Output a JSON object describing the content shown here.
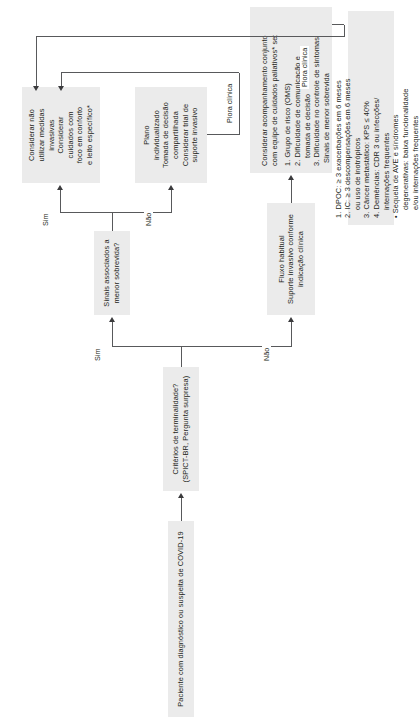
{
  "document": {
    "language": "pt-BR",
    "type": "flowchart",
    "orientation": "rotated-90-ccw"
  },
  "nodes": {
    "start": {
      "id": "start",
      "lines": [
        "Paciente com diagnóstico ou suspeita de COVID-19"
      ]
    },
    "criteria": {
      "id": "criteria",
      "lines": [
        "Critérios de terminalidade?",
        "(SPICT-BR, Pergunta surpresa)"
      ]
    },
    "survival": {
      "id": "survival",
      "lines": [
        "Sinais associados a",
        "menor sobrevida?"
      ]
    },
    "usual_flow": {
      "id": "usual_flow",
      "lines": [
        "Fluxo habitual",
        "Suporte invasivo conforme",
        "indicação clínica"
      ]
    },
    "individual_plan": {
      "id": "individual_plan",
      "lines": [
        "Plano",
        "individualizado",
        "Tomada de decisão",
        "compartilhada",
        "Considerar trial de",
        "suporte invasivo"
      ]
    },
    "no_invasive": {
      "id": "no_invasive",
      "lines": [
        "Considerar não",
        "utilizar medidas",
        "invasivas",
        "Considerar",
        "cuidados com",
        "foco em conforto",
        "e leito específico*"
      ]
    },
    "palliative": {
      "id": "palliative",
      "header": [
        "Considerar acompanhamento conjunto",
        "com equipe de cuidados paliativos* se:"
      ],
      "items": [
        "1. Grupo de risco (OMS)",
        "2. Dificuldade de comunicação e",
        "tomada de decisão",
        "3. Dificuldade no controle de sintomas"
      ]
    },
    "signs": {
      "id": "signs",
      "title": "Sinais de menor sobrevida",
      "items": [
        "1. DPOC: ≥ 3 exacerbações em 6 meses",
        "2. IC: ≥ 3 descompensações em 6 meses",
        "ou uso de inotrópicos",
        "3. Câncer metastático: KPS ≤ 40%",
        "4. Demências: CDR 3 ou infecções/",
        "internações frequentes",
        "•  Sequela de AVE e síndromes",
        "degenerativas: baixa funcionalidade",
        "e/ou internações frequentes"
      ]
    }
  },
  "edges": {
    "criteria_no": "Não",
    "criteria_yes": "Sim",
    "survival_no": "Não",
    "survival_yes": "Sim",
    "worsening_upper": "Piora clínica",
    "worsening_lower": "Piora clínica"
  },
  "colors": {
    "node_fill": "#ebebeb",
    "text": "#231f20",
    "connector": "#58595b",
    "background": "#ffffff"
  }
}
